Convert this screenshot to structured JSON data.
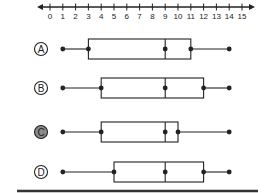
{
  "number_line": {
    "min": 0,
    "max": 15,
    "ticks": [
      0,
      1,
      2,
      3,
      4,
      5,
      6,
      7,
      8,
      9,
      10,
      11,
      12,
      13,
      14,
      15
    ],
    "tick_labels": [
      "0",
      "1",
      "2",
      "3",
      "4",
      "5",
      "6",
      "7",
      "8",
      "9",
      "10",
      "11",
      "12",
      "13",
      "14",
      "15"
    ],
    "arrows": "both"
  },
  "options": [
    {
      "letter": "A",
      "selected": false,
      "min": 1,
      "q1": 3,
      "median": 9,
      "q3": 11,
      "max": 14
    },
    {
      "letter": "B",
      "selected": false,
      "min": 1,
      "q1": 4,
      "median": 9,
      "q3": 12,
      "max": 14
    },
    {
      "letter": "C",
      "selected": true,
      "min": 1,
      "q1": 4,
      "median": 9,
      "q3": 10,
      "max": 14
    },
    {
      "letter": "D",
      "selected": false,
      "min": 1,
      "q1": 5,
      "median": 9,
      "q3": 12,
      "max": 14
    }
  ],
  "colors": {
    "ink": "#222222",
    "selected_fill": "#8a8a8a",
    "background": "#ffffff"
  },
  "chart_data": {
    "type": "boxplot",
    "title": "",
    "xlabel": "",
    "ylabel": "",
    "xlim": [
      0,
      15
    ],
    "x_ticks": [
      0,
      1,
      2,
      3,
      4,
      5,
      6,
      7,
      8,
      9,
      10,
      11,
      12,
      13,
      14,
      15
    ],
    "series": [
      {
        "name": "A",
        "min": 1,
        "q1": 3,
        "median": 9,
        "q3": 11,
        "max": 14
      },
      {
        "name": "B",
        "min": 1,
        "q1": 4,
        "median": 9,
        "q3": 12,
        "max": 14
      },
      {
        "name": "C",
        "min": 1,
        "q1": 4,
        "median": 9,
        "q3": 10,
        "max": 14
      },
      {
        "name": "D",
        "min": 1,
        "q1": 5,
        "median": 9,
        "q3": 12,
        "max": 14
      }
    ],
    "selected": "C",
    "grid": false
  }
}
